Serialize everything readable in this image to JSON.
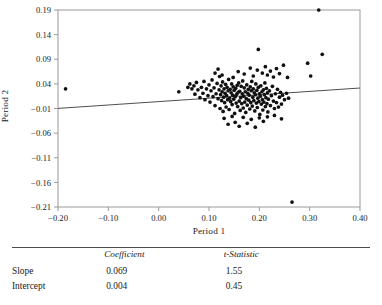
{
  "chart_data": {
    "type": "scatter",
    "title": "",
    "xlabel": "Period 1",
    "ylabel": "Period 2",
    "xlim": [
      -0.2,
      0.4
    ],
    "ylim": [
      -0.21,
      0.19
    ],
    "xticks": [
      "-0.20",
      "-0.10",
      "0.00",
      "0.10",
      "0.20",
      "0.30",
      "0.40"
    ],
    "xtick_values": [
      -0.2,
      -0.1,
      0.0,
      0.1,
      0.2,
      0.3,
      0.4
    ],
    "yticks": [
      "0.19",
      "0.14",
      "0.09",
      "0.04",
      "-0.01",
      "-0.06",
      "-0.11",
      "-0.16",
      "-0.21"
    ],
    "ytick_values": [
      0.19,
      0.14,
      0.09,
      0.04,
      -0.01,
      -0.06,
      -0.11,
      -0.16,
      -0.21
    ],
    "grid": false,
    "legend": "none",
    "marker_color": "#111111",
    "line_color": "#3a3a3a",
    "frame_color": "#9a9a9a",
    "fit_line": {
      "slope": 0.069,
      "intercept": 0.004,
      "x_start": -0.2,
      "x_end": 0.4,
      "y_start": -0.0098,
      "y_end": 0.0316
    },
    "points": [
      [
        -0.185,
        0.03
      ],
      [
        0.04,
        0.024
      ],
      [
        0.058,
        0.033
      ],
      [
        0.062,
        0.04
      ],
      [
        0.066,
        0.03
      ],
      [
        0.07,
        0.036
      ],
      [
        0.072,
        0.019
      ],
      [
        0.075,
        0.043
      ],
      [
        0.078,
        0.028
      ],
      [
        0.082,
        0.012
      ],
      [
        0.085,
        0.033
      ],
      [
        0.088,
        0.021
      ],
      [
        0.09,
        0.045
      ],
      [
        0.092,
        0.008
      ],
      [
        0.095,
        0.03
      ],
      [
        0.098,
        0.016
      ],
      [
        0.1,
        0.038
      ],
      [
        0.102,
        0.003
      ],
      [
        0.104,
        0.026
      ],
      [
        0.106,
        0.048
      ],
      [
        0.108,
        0.014
      ],
      [
        0.11,
        0.032
      ],
      [
        0.112,
        -0.004
      ],
      [
        0.114,
        0.02
      ],
      [
        0.116,
        0.041
      ],
      [
        0.118,
        0.01
      ],
      [
        0.12,
        0.028
      ],
      [
        0.121,
        0.055
      ],
      [
        0.122,
        -0.01
      ],
      [
        0.123,
        0.018
      ],
      [
        0.124,
        0.036
      ],
      [
        0.125,
        0.006
      ],
      [
        0.126,
        0.024
      ],
      [
        0.127,
        0.044
      ],
      [
        0.128,
        -0.016
      ],
      [
        0.129,
        0.013
      ],
      [
        0.13,
        0.03
      ],
      [
        0.131,
        0.002
      ],
      [
        0.132,
        0.021
      ],
      [
        0.133,
        0.039
      ],
      [
        0.134,
        -0.007
      ],
      [
        0.135,
        0.016
      ],
      [
        0.136,
        0.033
      ],
      [
        0.137,
        0.008
      ],
      [
        0.138,
        0.026
      ],
      [
        0.139,
        0.049
      ],
      [
        0.14,
        -0.012
      ],
      [
        0.141,
        0.011
      ],
      [
        0.142,
        0.029
      ],
      [
        0.143,
        0.004
      ],
      [
        0.144,
        0.022
      ],
      [
        0.145,
        0.04
      ],
      [
        0.146,
        -0.002
      ],
      [
        0.147,
        0.017
      ],
      [
        0.148,
        0.034
      ],
      [
        0.149,
        0.009
      ],
      [
        0.15,
        0.027
      ],
      [
        0.151,
        -0.02
      ],
      [
        0.152,
        0.014
      ],
      [
        0.153,
        0.031
      ],
      [
        0.154,
        0.001
      ],
      [
        0.155,
        0.019
      ],
      [
        0.156,
        0.037
      ],
      [
        0.157,
        -0.006
      ],
      [
        0.158,
        0.023
      ],
      [
        0.159,
        0.042
      ],
      [
        0.16,
        0.005
      ],
      [
        0.161,
        0.025
      ],
      [
        0.162,
        -0.014
      ],
      [
        0.163,
        0.012
      ],
      [
        0.164,
        0.035
      ],
      [
        0.165,
        0.0
      ],
      [
        0.166,
        0.02
      ],
      [
        0.167,
        0.046
      ],
      [
        0.168,
        -0.009
      ],
      [
        0.169,
        0.015
      ],
      [
        0.17,
        0.032
      ],
      [
        0.171,
        0.003
      ],
      [
        0.172,
        0.024
      ],
      [
        0.173,
        -0.018
      ],
      [
        0.174,
        0.01
      ],
      [
        0.175,
        0.038
      ],
      [
        0.176,
        -0.003
      ],
      [
        0.177,
        0.021
      ],
      [
        0.178,
        0.029
      ],
      [
        0.179,
        0.007
      ],
      [
        0.18,
        0.017
      ],
      [
        0.181,
        -0.011
      ],
      [
        0.182,
        0.034
      ],
      [
        0.183,
        0.002
      ],
      [
        0.184,
        0.026
      ],
      [
        0.185,
        0.045
      ],
      [
        0.186,
        -0.005
      ],
      [
        0.187,
        0.013
      ],
      [
        0.188,
        0.03
      ],
      [
        0.189,
        0.006
      ],
      [
        0.19,
        0.022
      ],
      [
        0.191,
        -0.015
      ],
      [
        0.192,
        0.018
      ],
      [
        0.193,
        0.04
      ],
      [
        0.194,
        0.001
      ],
      [
        0.195,
        0.027
      ],
      [
        0.196,
        -0.008
      ],
      [
        0.197,
        0.011
      ],
      [
        0.198,
        0.033
      ],
      [
        0.199,
        0.004
      ],
      [
        0.2,
        0.02
      ],
      [
        0.201,
        -0.022
      ],
      [
        0.202,
        0.015
      ],
      [
        0.203,
        0.036
      ],
      [
        0.204,
        -0.001
      ],
      [
        0.205,
        0.024
      ],
      [
        0.206,
        0.008
      ],
      [
        0.207,
        -0.013
      ],
      [
        0.208,
        0.028
      ],
      [
        0.209,
        0.003
      ],
      [
        0.21,
        0.018
      ],
      [
        0.211,
        0.042
      ],
      [
        0.212,
        -0.006
      ],
      [
        0.213,
        0.012
      ],
      [
        0.214,
        0.031
      ],
      [
        0.215,
        0.0
      ],
      [
        0.216,
        0.022
      ],
      [
        0.217,
        -0.017
      ],
      [
        0.218,
        0.009
      ],
      [
        0.22,
        0.026
      ],
      [
        0.222,
        -0.004
      ],
      [
        0.224,
        0.016
      ],
      [
        0.226,
        0.035
      ],
      [
        0.228,
        0.005
      ],
      [
        0.23,
        -0.01
      ],
      [
        0.232,
        0.02
      ],
      [
        0.234,
        0.002
      ],
      [
        0.236,
        0.029
      ],
      [
        0.238,
        -0.007
      ],
      [
        0.24,
        0.013
      ],
      [
        0.242,
        0.023
      ],
      [
        0.244,
        -0.001
      ],
      [
        0.246,
        0.017
      ],
      [
        0.25,
        0.008
      ],
      [
        0.254,
        0.021
      ],
      [
        0.258,
        0.011
      ],
      [
        0.112,
        0.062
      ],
      [
        0.118,
        0.07
      ],
      [
        0.126,
        0.058
      ],
      [
        0.148,
        0.053
      ],
      [
        0.158,
        0.065
      ],
      [
        0.17,
        0.06
      ],
      [
        0.182,
        0.072
      ],
      [
        0.188,
        0.056
      ],
      [
        0.196,
        0.068
      ],
      [
        0.198,
        0.11
      ],
      [
        0.206,
        0.062
      ],
      [
        0.212,
        0.075
      ],
      [
        0.216,
        0.058
      ],
      [
        0.222,
        0.066
      ],
      [
        0.228,
        0.054
      ],
      [
        0.234,
        0.071
      ],
      [
        0.24,
        0.061
      ],
      [
        0.248,
        0.078
      ],
      [
        0.256,
        0.053
      ],
      [
        0.13,
        -0.03
      ],
      [
        0.138,
        -0.042
      ],
      [
        0.146,
        -0.026
      ],
      [
        0.152,
        -0.038
      ],
      [
        0.16,
        -0.046
      ],
      [
        0.168,
        -0.028
      ],
      [
        0.176,
        -0.04
      ],
      [
        0.184,
        -0.032
      ],
      [
        0.192,
        -0.048
      ],
      [
        0.2,
        -0.029
      ],
      [
        0.208,
        -0.036
      ],
      [
        0.216,
        -0.027
      ],
      [
        0.23,
        -0.024
      ],
      [
        0.244,
        -0.031
      ],
      [
        0.296,
        0.082
      ],
      [
        0.302,
        0.056
      ],
      [
        0.318,
        0.19
      ],
      [
        0.325,
        0.1
      ],
      [
        0.265,
        -0.2
      ]
    ]
  },
  "table": {
    "columns": [
      "",
      "Coefficient",
      "t-Statistic"
    ],
    "rows": [
      {
        "label": "Slope",
        "coefficient": "0.069",
        "t_statistic": "1.55"
      },
      {
        "label": "Intercept",
        "coefficient": "0.004",
        "t_statistic": "0.45"
      }
    ]
  }
}
